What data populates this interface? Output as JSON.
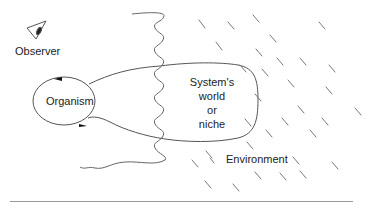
{
  "diagram": {
    "observer_label": "Observer",
    "organism_label": "Organism",
    "niche_label_lines": [
      "System's",
      "world",
      "or",
      "niche"
    ],
    "environment_label": "Environment",
    "icons": {
      "observer": "eye-icon"
    },
    "colors": {
      "stroke": "#555555",
      "text": "#222222",
      "dash": "#777777",
      "background": "#ffffff"
    }
  }
}
